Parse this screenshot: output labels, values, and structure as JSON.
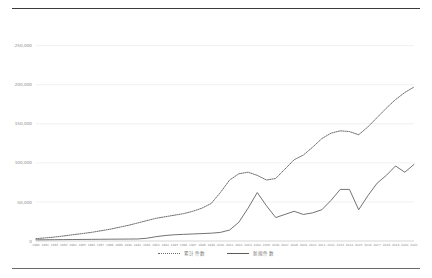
{
  "chart_data": {
    "type": "line",
    "title": "",
    "subtitle": "",
    "xlabel": "",
    "ylabel": "",
    "ylim": [
      0,
      270000
    ],
    "yticks": [
      0,
      50000,
      100000,
      150000,
      200000,
      250000
    ],
    "ytick_labels": [
      "0",
      "50,000",
      "100,000",
      "150,000",
      "200,000",
      "250,000"
    ],
    "grid": true,
    "legend_position": "bottom-center",
    "categories": [
      "1980",
      "1981",
      "1982",
      "1983",
      "1984",
      "1985",
      "1986",
      "1987",
      "1988",
      "1989",
      "1990",
      "1991",
      "1992",
      "1993",
      "1994",
      "1995",
      "1996",
      "1997",
      "1998",
      "1999",
      "2000",
      "2001",
      "2002",
      "2003",
      "2004",
      "2005",
      "2006",
      "2007",
      "2008",
      "2009",
      "2010",
      "2011",
      "2012",
      "2013",
      "2014",
      "2015",
      "2016",
      "2017",
      "2018",
      "2019",
      "2020",
      "2021"
    ],
    "series": [
      {
        "name": "累計件数",
        "style": "dotted",
        "color": "#6d6d6d",
        "values": [
          3000,
          4000,
          5000,
          6500,
          8000,
          9500,
          11000,
          13000,
          15000,
          17500,
          20000,
          23000,
          26000,
          29000,
          31000,
          33000,
          35000,
          38000,
          42000,
          48000,
          62000,
          78000,
          86000,
          88000,
          84000,
          78000,
          80000,
          92000,
          104000,
          110000,
          120000,
          131000,
          138000,
          141000,
          140000,
          136000,
          146000,
          158000,
          170000,
          181000,
          190000,
          197000
        ]
      },
      {
        "name": "新規件数",
        "style": "solid",
        "color": "#5a5a5a",
        "values": [
          1500,
          1600,
          1700,
          1800,
          1900,
          2000,
          2100,
          2200,
          2300,
          2400,
          2500,
          2600,
          3500,
          5500,
          7000,
          8000,
          8500,
          9000,
          9500,
          10000,
          11000,
          14000,
          24000,
          42000,
          62000,
          45000,
          30000,
          34000,
          38000,
          34000,
          36000,
          40000,
          52000,
          66000,
          66000,
          40000,
          58000,
          74000,
          84000,
          96000,
          88000,
          98000
        ]
      }
    ],
    "series_endpoints": {
      "dotted_final": 235000,
      "solid_final": 145000
    }
  },
  "legend": {
    "items": [
      {
        "label": "累計件数",
        "marker": "dotted-line-marker"
      },
      {
        "label": "新規件数",
        "marker": "solid-line-marker"
      }
    ]
  }
}
